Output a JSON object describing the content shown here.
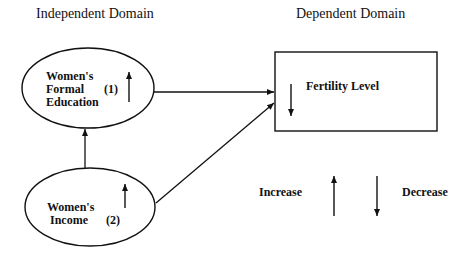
{
  "domains": {
    "independent_title": "Independent Domain",
    "dependent_title": "Dependent Domain"
  },
  "nodes": [
    {
      "id": "education",
      "line1": "Women's",
      "line2": "Formal",
      "line3": "Education",
      "number": "(1)",
      "direction": "increase"
    },
    {
      "id": "income",
      "line1": "Women's",
      "line2": "Income",
      "number": "(2)",
      "direction": "increase"
    },
    {
      "id": "fertility",
      "label": "Fertility Level",
      "direction": "decrease"
    }
  ],
  "edges": [
    {
      "from": "income",
      "to": "education"
    },
    {
      "from": "education",
      "to": "fertility"
    },
    {
      "from": "income",
      "to": "fertility"
    }
  ],
  "legend": {
    "increase_label": "Increase",
    "decrease_label": "Decrease"
  },
  "colors": {
    "stroke": "#111111",
    "background": "#ffffff"
  }
}
